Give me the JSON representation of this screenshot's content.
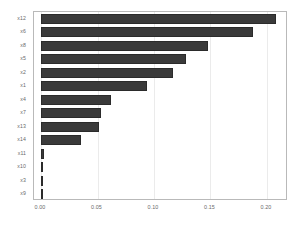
{
  "chart_data": {
    "type": "bar",
    "orientation": "horizontal",
    "title": "",
    "xlabel": "",
    "ylabel": "",
    "categories": [
      "x12",
      "x6",
      "x8",
      "x5",
      "x2",
      "x1",
      "x4",
      "x7",
      "x13",
      "x14",
      "x11",
      "x10",
      "x3",
      "x9"
    ],
    "values": [
      0.208,
      0.188,
      0.148,
      0.128,
      0.117,
      0.094,
      0.062,
      0.053,
      0.051,
      0.035,
      0.003,
      0.0,
      0.0,
      0.0
    ],
    "xlim": [
      -0.0062,
      0.2186
    ],
    "xticks": [
      0.0,
      0.05,
      0.1,
      0.15,
      0.2
    ],
    "xticklabels": [
      "0.00",
      "0.05",
      "0.10",
      "0.15",
      "0.20"
    ],
    "grid": true,
    "grid_axis": "x",
    "legend": null,
    "bar_color": "#3a3a3a",
    "bar_edge_color": "#2b2b2b",
    "frame_color": "#b9b9b9",
    "grid_color": "#ebebeb",
    "background": "#ffffff",
    "tick_label_color": "#6a6a6a"
  }
}
